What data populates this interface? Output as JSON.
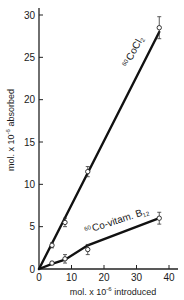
{
  "chart_data": {
    "type": "line",
    "title": "",
    "xlabel": "mol. x 10^-6 introduced",
    "ylabel": "mol. x 10^-6 absorbed",
    "xlabel_parts": {
      "pre": "mol. x 10",
      "exp": "-6",
      "post": " introduced"
    },
    "ylabel_parts": {
      "pre": "mol. x 10",
      "exp": "-6",
      "post": " absorbed"
    },
    "xlim": [
      0,
      40
    ],
    "ylim": [
      0,
      30
    ],
    "x_ticks": [
      0,
      10,
      20,
      30,
      40
    ],
    "y_ticks": [
      0,
      5,
      10,
      15,
      20,
      25,
      30
    ],
    "x_tick_labels": [
      "0",
      "10",
      "20",
      "30",
      "40"
    ],
    "y_tick_labels": [
      "0",
      "5",
      "10",
      "15",
      "20",
      "25",
      "30"
    ],
    "grid": false,
    "legend": "inline labels along lines",
    "series": [
      {
        "name": "60CoCl2",
        "label_sup": "60",
        "label_main": "CoCl",
        "label_sub": "2",
        "x": [
          0,
          4,
          8,
          15,
          37
        ],
        "y": [
          0,
          2.8,
          5.5,
          11.5,
          28.5
        ],
        "error": [
          0,
          0.3,
          0.5,
          0.6,
          1.3
        ],
        "fit_line": [
          [
            0,
            0
          ],
          [
            37,
            28.0
          ]
        ]
      },
      {
        "name": "60Co-vitam. B12",
        "label_sup": "60",
        "label_main": "Co-vitam. B",
        "label_sub": "12",
        "x": [
          0,
          4,
          8,
          15,
          37
        ],
        "y": [
          0,
          0.7,
          1.2,
          2.3,
          6.0
        ],
        "error": [
          0,
          0.2,
          0.5,
          0.6,
          0.7
        ],
        "fit_line": [
          [
            0,
            0
          ],
          [
            4,
            0.6
          ],
          [
            8,
            1.1
          ],
          [
            15,
            2.8
          ],
          [
            37,
            6.0
          ]
        ]
      }
    ]
  }
}
